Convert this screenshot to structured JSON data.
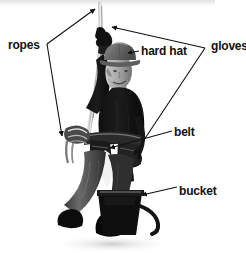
{
  "image": {
    "kind": "annotated-photo",
    "subject": "construction worker in safety gear holding a rope with a bucket",
    "width": 246,
    "height": 253,
    "background_color": "#ffffff",
    "top_band_color": "#e8e8e8",
    "ink_color": "#111111"
  },
  "callouts": [
    {
      "id": "ropes",
      "label": "ropes",
      "label_x": 8,
      "label_y": 39,
      "arrow_count": 2,
      "targets": [
        "rope above hand",
        "rope coil on belt"
      ]
    },
    {
      "id": "hard-hat",
      "label": "hard hat",
      "label_x": 141,
      "label_y": 45,
      "arrow_count": 1,
      "targets": [
        "helmet on head"
      ]
    },
    {
      "id": "gloves",
      "label": "gloves",
      "label_x": 211,
      "label_y": 40,
      "arrow_count": 2,
      "targets": [
        "raised gloved hand",
        "lowered gloved hand"
      ]
    },
    {
      "id": "belt",
      "label": "belt",
      "label_x": 174,
      "label_y": 126,
      "arrow_count": 1,
      "targets": [
        "tool belt at waist"
      ]
    },
    {
      "id": "bucket",
      "label": "bucket",
      "label_x": 179,
      "label_y": 185,
      "arrow_count": 1,
      "targets": [
        "bucket on ground"
      ]
    }
  ],
  "photo_parts": {
    "hard_hat": "hard hat",
    "head": "head",
    "torso": "torso",
    "raised_arm": "raised arm",
    "raised_glove": "raised glove",
    "lower_arm": "lower arm",
    "lower_glove": "lower glove",
    "rope": "rope",
    "rope_coil": "rope coil",
    "tool_belt": "tool belt",
    "legs": "legs",
    "boots": "boots",
    "bucket": "bucket",
    "bucket_hose": "bucket hose",
    "shadow": "ground shadow"
  }
}
